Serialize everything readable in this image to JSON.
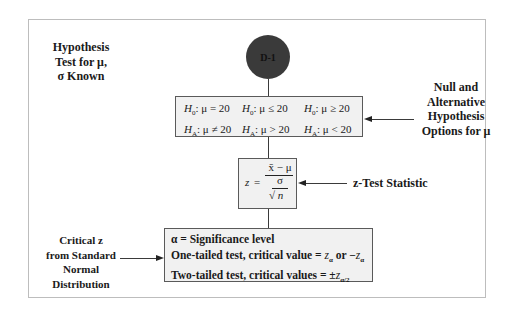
{
  "title_label": [
    "Hypothesis",
    "Test for μ,",
    "σ Known"
  ],
  "node": {
    "id": "D-1",
    "color": "#3a3a3a"
  },
  "hypotheses": {
    "rows": [
      [
        {
          "h": "H",
          "sub": "0",
          "rel": ": μ = 20"
        },
        {
          "h": "H",
          "sub": "0",
          "rel": ": μ ≤ 20"
        },
        {
          "h": "H",
          "sub": "0",
          "rel": ": μ ≥ 20"
        }
      ],
      [
        {
          "h": "H",
          "sub": "A",
          "rel": ": μ ≠ 20"
        },
        {
          "h": "H",
          "sub": "A",
          "rel": ": μ > 20"
        },
        {
          "h": "H",
          "sub": "A",
          "rel": ": μ < 20"
        }
      ]
    ],
    "callout": [
      "Null and",
      "Alternative",
      "Hypothesis",
      "Options for μ"
    ]
  },
  "formula": {
    "lhs": "z",
    "eq": "=",
    "numerator": "x̄ − μ",
    "denominator_top": "σ",
    "denominator_bottom": "√ n",
    "callout": "z-Test Statistic"
  },
  "critical": {
    "lines": {
      "l1": "α = Significance level",
      "l2_prefix": "One-tailed test, critical value = ",
      "l2_z1": "z",
      "l2_sub1": "α",
      "l2_mid": " or −",
      "l2_z2": "z",
      "l2_sub2": "α",
      "l3_prefix": "Two-tailed test, critical values = ±",
      "l3_z": "z",
      "l3_sub": "α/2"
    },
    "callout": [
      "Critical z",
      "from Standard",
      "Normal",
      "Distribution"
    ]
  }
}
